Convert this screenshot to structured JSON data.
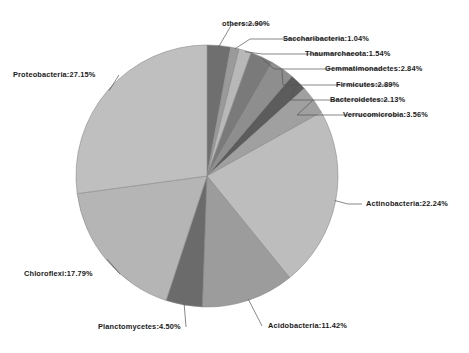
{
  "chart_data": {
    "type": "pie",
    "title": "",
    "subtitle": "",
    "xlabel": "",
    "ylabel": "",
    "legend_position": "none",
    "grid": false,
    "label_format": "name:value%",
    "start_angle_deg": 0,
    "direction": "clockwise",
    "units": "percent",
    "total": 100.0,
    "categories": [
      "others",
      "Saccharibacteria",
      "Thaumarchaeota",
      "Gemmatimonadetes",
      "Firmicutes",
      "Bacteroidetes",
      "Verrucomicrobia",
      "Actinobacteria",
      "Acidobacteria",
      "Planctomycetes",
      "Chloroflexi",
      "Proteobacteria"
    ],
    "values": [
      2.9,
      1.04,
      1.54,
      2.84,
      2.89,
      2.13,
      3.56,
      22.24,
      11.42,
      4.5,
      17.79,
      27.15
    ],
    "colors": [
      "#6f6f6f",
      "#9a9a9a",
      "#b8b8b8",
      "#7a7a7a",
      "#8e8e8e",
      "#5c5c5c",
      "#a0a0a0",
      "#bdbdbd",
      "#9c9c9c",
      "#6b6b6b",
      "#b5b5b5",
      "#bfbfbf"
    ]
  },
  "labels": [
    {
      "name": "others",
      "text": "others:2.90%"
    },
    {
      "name": "saccharibacteria",
      "text": "Saccharibacteria:1.04%"
    },
    {
      "name": "thaumarchaeota",
      "text": "Thaumarchaeota:1.54%"
    },
    {
      "name": "gemmatimonadetes",
      "text": "Gemmatimonadetes:2.84%"
    },
    {
      "name": "firmicutes",
      "text": "Firmicutes:2.89%"
    },
    {
      "name": "bacteroidetes",
      "text": "Bacteroidetes:2.13%"
    },
    {
      "name": "verrucomicrobia",
      "text": "Verrucomicrobia:3.56%"
    },
    {
      "name": "actinobacteria",
      "text": "Actinobacteria:22.24%"
    },
    {
      "name": "acidobacteria",
      "text": "Acidobacteria:11.42%"
    },
    {
      "name": "planctomycetes",
      "text": "Planctomycetes:4.50%"
    },
    {
      "name": "chloroflexi",
      "text": "Chloroflexi:17.79%"
    },
    {
      "name": "proteobacteria",
      "text": "Proteobacteria:27.15%"
    }
  ],
  "geometry": {
    "center_x": 207,
    "center_y": 176,
    "radius": 131
  },
  "style": {
    "background": "#ffffff",
    "leader_line_color": "#555555",
    "slice_edge_color": "#8a8a8a",
    "text_color": "#1a1a1a"
  }
}
